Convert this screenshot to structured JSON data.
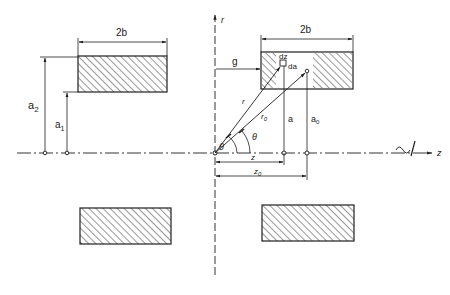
{
  "diagram": {
    "type": "coil-geometry",
    "colors": {
      "ink": "#1e1e1e",
      "background": "#ffffff"
    },
    "axes": {
      "r_label": "r",
      "z_label": "z"
    },
    "labels": {
      "width_left": "2b",
      "width_right": "2b",
      "a2": "a",
      "a2_sub": "2",
      "a1": "a",
      "a1_sub": "1",
      "g": "g",
      "dz": "dz",
      "da": "da",
      "r": "r",
      "r0": "r",
      "r0_sub": "0",
      "theta_outer": "θ",
      "theta_inner": "θ",
      "a": "a",
      "a0": "a",
      "a0_sub": "0",
      "z": "z",
      "z0": "z",
      "z0_sub": "0"
    },
    "coils": [
      {
        "name": "upper-left-coil",
        "hatched": true
      },
      {
        "name": "upper-right-coil",
        "hatched": true,
        "partially_hatched": true
      },
      {
        "name": "lower-left-coil",
        "hatched": true
      },
      {
        "name": "lower-right-coil",
        "hatched": true
      }
    ]
  }
}
